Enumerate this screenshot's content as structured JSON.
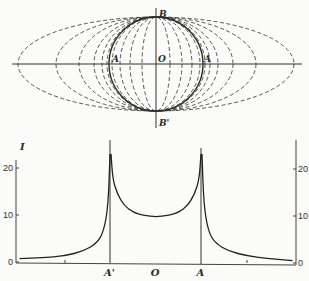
{
  "diagram": {
    "type": "confocal-ellipses-projection",
    "labels": {
      "top_pole": "B",
      "bottom_pole": "B'",
      "center": "O",
      "left_point": "A",
      "right_point": "A"
    },
    "center": [
      156,
      64
    ],
    "circle_radius": 47,
    "ellipse_semi_x": [
      138,
      100,
      77,
      62,
      54,
      49,
      44,
      36,
      26,
      14
    ],
    "ellipse_semi_y": 47,
    "colors": {
      "ink": "#333333",
      "background": "#fbfbfa"
    }
  },
  "chart_data": {
    "type": "line",
    "title": "",
    "ylabel": "I",
    "xlabel": "",
    "x_tick_labels": [
      "A'",
      "O",
      "A"
    ],
    "x_tick_positions": [
      -1,
      0,
      1
    ],
    "y_ticks_left": [
      "0",
      "10",
      "20"
    ],
    "y_ticks_right": [
      "0",
      "10",
      "20"
    ],
    "ylim": [
      0,
      26
    ],
    "xlim": [
      -3,
      3
    ],
    "grid": false,
    "legend": null,
    "series": [
      {
        "name": "I",
        "x": [
          -3.0,
          -2.5,
          -2.0,
          -1.6,
          -1.3,
          -1.15,
          -1.05,
          -1.01,
          -0.99,
          -0.95,
          -0.85,
          -0.7,
          -0.5,
          -0.25,
          0.0,
          0.25,
          0.5,
          0.7,
          0.85,
          0.95,
          0.99,
          1.01,
          1.05,
          1.15,
          1.3,
          1.6,
          2.0,
          2.5,
          3.0
        ],
        "y": [
          0.7,
          0.9,
          1.3,
          2.3,
          4.0,
          6.5,
          12.0,
          23.0,
          23.0,
          17.5,
          14.5,
          12.0,
          10.5,
          9.9,
          9.6,
          9.9,
          10.5,
          12.0,
          14.5,
          17.5,
          23.0,
          23.0,
          12.0,
          6.5,
          4.0,
          2.3,
          1.3,
          0.7,
          0.3
        ]
      }
    ],
    "annotations": [
      "vertical lines at A' and A"
    ]
  }
}
